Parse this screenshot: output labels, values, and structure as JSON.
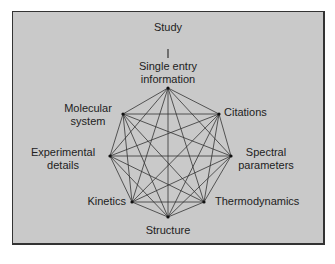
{
  "diagram": {
    "root": "Study",
    "colors": {
      "background": "#c9c9c9",
      "line": "#333333",
      "border": "#333333"
    },
    "nodes": [
      {
        "id": "single",
        "label": "Single entry information",
        "x": 168,
        "y": 88
      },
      {
        "id": "citations",
        "label": "Citations",
        "x": 219,
        "y": 114
      },
      {
        "id": "spectral",
        "label": "Spectral parameters",
        "x": 231,
        "y": 156
      },
      {
        "id": "thermo",
        "label": "Thermodynamics",
        "x": 204,
        "y": 202
      },
      {
        "id": "structure",
        "label": "Structure",
        "x": 168,
        "y": 217
      },
      {
        "id": "kinetics",
        "label": "Kinetics",
        "x": 132,
        "y": 202
      },
      {
        "id": "experimental",
        "label": "Experimental details",
        "x": 110,
        "y": 156
      },
      {
        "id": "molecular",
        "label": "Molecular system",
        "x": 123,
        "y": 114
      }
    ],
    "labels": {
      "study": "Study",
      "single_1": "Single entry",
      "single_2": "information",
      "citations": "Citations",
      "spectral_1": "Spectral",
      "spectral_2": "parameters",
      "thermo": "Thermodynamics",
      "structure": "Structure",
      "kinetics": "Kinetics",
      "experimental_1": "Experimental",
      "experimental_2": "details",
      "molecular_1": "Molecular",
      "molecular_2": "system"
    },
    "edges": "complete graph: every node connected to every other node"
  }
}
